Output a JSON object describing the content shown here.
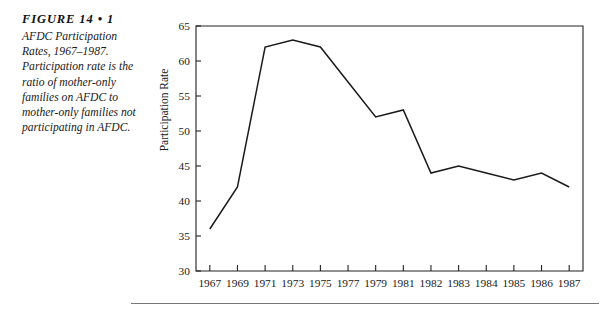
{
  "caption": {
    "figure_number": "FIGURE 14 • 1",
    "text": "AFDC Participation Rates, 1967–1987. Participation rate is the ratio of mother-only families on AFDC to mother-only families not participating in AFDC."
  },
  "colors": {
    "line": "#1a1a1a",
    "axis": "#222222",
    "rule": "#777777",
    "background": "#ffffff"
  },
  "chart_data": {
    "type": "line",
    "title": "",
    "xlabel": "",
    "ylabel": "Participation Rate",
    "categories": [
      "1967",
      "1969",
      "1971",
      "1973",
      "1975",
      "1977",
      "1979",
      "1981",
      "1982",
      "1983",
      "1984",
      "1985",
      "1986",
      "1987"
    ],
    "values": [
      36,
      42,
      62,
      63,
      62,
      57,
      52,
      53,
      44,
      45,
      44,
      43,
      44,
      42
    ],
    "series": [
      {
        "name": "AFDC Participation Rate",
        "values": [
          36,
          42,
          62,
          63,
          62,
          57,
          52,
          53,
          44,
          45,
          44,
          43,
          44,
          42
        ]
      }
    ],
    "ylim": [
      30,
      65
    ],
    "yticks": [
      30,
      35,
      40,
      45,
      50,
      55,
      60,
      65
    ],
    "ytick_labels": [
      "30",
      "35",
      "40",
      "45",
      "50",
      "55",
      "60",
      "65"
    ],
    "grid": false,
    "legend": false,
    "legend_position": "none",
    "frame": "box"
  }
}
